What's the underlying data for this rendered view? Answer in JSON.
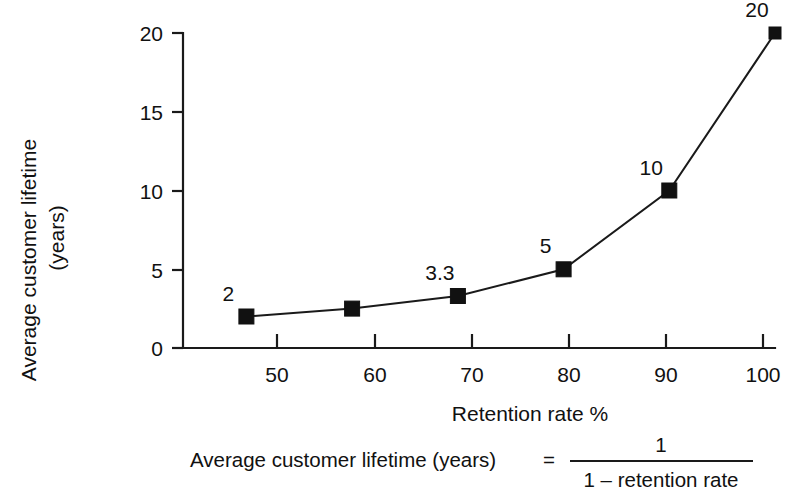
{
  "chart_data": {
    "type": "line",
    "title": "",
    "xlabel": "Retention rate %",
    "ylabel_line1": "Average customer lifetime",
    "ylabel_line2": "(years)",
    "x": [
      50,
      60,
      70,
      80,
      90,
      100
    ],
    "values": [
      2,
      2.5,
      3.3,
      5,
      10,
      20
    ],
    "point_labels": [
      "2",
      "",
      "3.3",
      "5",
      "10",
      "20"
    ],
    "xticks": [
      "50",
      "60",
      "70",
      "80",
      "90",
      "100"
    ],
    "yticks": [
      "0",
      "5",
      "10",
      "15",
      "20"
    ],
    "ytick_values": [
      0,
      5,
      10,
      15,
      20
    ],
    "xlim": [
      44,
      100
    ],
    "ylim": [
      0,
      20
    ],
    "grid": false,
    "legend": false,
    "marker": "square",
    "series_color": "#111111"
  },
  "formula": {
    "left": "Average customer lifetime (years)",
    "equals": "=",
    "numerator": "1",
    "denominator": "1  –  retention rate"
  },
  "colors": {
    "background": "#ffffff",
    "ink": "#111111",
    "axis": "#1a1a1a"
  }
}
